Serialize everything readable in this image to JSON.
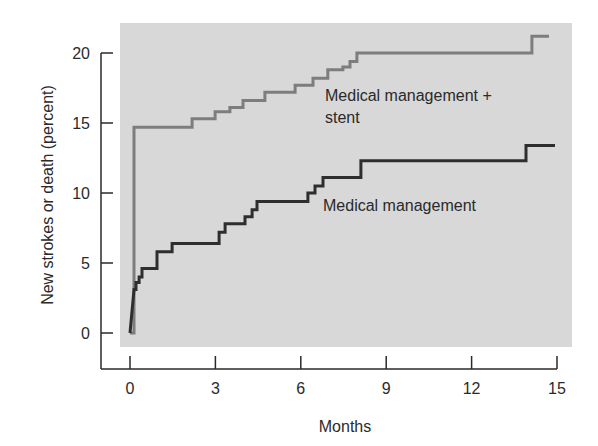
{
  "chart_data": {
    "type": "line",
    "subtype": "step (Kaplan-Meier cumulative incidence)",
    "title": "",
    "xlabel": "Months",
    "ylabel": "New strokes or death (percent)",
    "xlim": [
      0,
      15
    ],
    "ylim": [
      0,
      20
    ],
    "x_ticks": [
      0,
      3,
      6,
      9,
      12,
      15
    ],
    "y_ticks": [
      0,
      5,
      10,
      15,
      20
    ],
    "grid": false,
    "legend": "inline labels",
    "plot_background": "#d8d8d8",
    "series": [
      {
        "name": "Medical management + stent",
        "label_lines": [
          "Medical management +",
          "stent"
        ],
        "color": "#7d7d7d",
        "points": [
          [
            0.0,
            0.0
          ],
          [
            0.14,
            0.0
          ],
          [
            0.14,
            14.7
          ],
          [
            2.18,
            14.7
          ],
          [
            2.18,
            15.3
          ],
          [
            2.99,
            15.3
          ],
          [
            2.99,
            15.8
          ],
          [
            3.51,
            15.8
          ],
          [
            3.51,
            16.1
          ],
          [
            3.97,
            16.1
          ],
          [
            3.97,
            16.6
          ],
          [
            4.74,
            16.6
          ],
          [
            4.74,
            17.2
          ],
          [
            5.8,
            17.2
          ],
          [
            5.8,
            17.7
          ],
          [
            6.43,
            17.7
          ],
          [
            6.43,
            18.2
          ],
          [
            6.95,
            18.2
          ],
          [
            6.95,
            18.8
          ],
          [
            7.48,
            18.8
          ],
          [
            7.48,
            19.0
          ],
          [
            7.73,
            19.0
          ],
          [
            7.73,
            19.4
          ],
          [
            7.97,
            19.4
          ],
          [
            7.97,
            20.0
          ],
          [
            14.12,
            20.0
          ],
          [
            14.12,
            21.2
          ],
          [
            14.72,
            21.2
          ]
        ]
      },
      {
        "name": "Medical management",
        "label_lines": [
          "Medical management"
        ],
        "color": "#2e2e2e",
        "points": [
          [
            0.0,
            0.0
          ],
          [
            0.14,
            3.1
          ],
          [
            0.21,
            3.1
          ],
          [
            0.21,
            3.6
          ],
          [
            0.32,
            3.6
          ],
          [
            0.32,
            4.0
          ],
          [
            0.42,
            4.0
          ],
          [
            0.42,
            4.6
          ],
          [
            0.95,
            4.6
          ],
          [
            0.95,
            5.8
          ],
          [
            1.48,
            5.8
          ],
          [
            1.48,
            6.4
          ],
          [
            3.13,
            6.4
          ],
          [
            3.13,
            7.2
          ],
          [
            3.34,
            7.2
          ],
          [
            3.34,
            7.8
          ],
          [
            4.04,
            7.8
          ],
          [
            4.04,
            8.3
          ],
          [
            4.29,
            8.3
          ],
          [
            4.29,
            8.8
          ],
          [
            4.46,
            8.8
          ],
          [
            4.46,
            9.4
          ],
          [
            6.25,
            9.4
          ],
          [
            6.25,
            10.0
          ],
          [
            6.5,
            10.0
          ],
          [
            6.5,
            10.5
          ],
          [
            6.78,
            10.5
          ],
          [
            6.78,
            11.1
          ],
          [
            8.11,
            11.1
          ],
          [
            8.11,
            12.3
          ],
          [
            13.91,
            12.3
          ],
          [
            13.91,
            13.4
          ],
          [
            14.93,
            13.4
          ]
        ]
      }
    ]
  },
  "layout": {
    "x0_px": 130,
    "x15_px": 557,
    "y0_px": 333,
    "y20_px": 53,
    "axis_x_px": 101,
    "axis_y_px": 369,
    "bg": {
      "x": 120,
      "y": 23,
      "w": 452,
      "h": 324
    }
  },
  "series_label_positions": [
    {
      "x": 325,
      "y": 101,
      "line_gap": 22
    },
    {
      "x": 323,
      "y": 211,
      "line_gap": 22
    }
  ]
}
